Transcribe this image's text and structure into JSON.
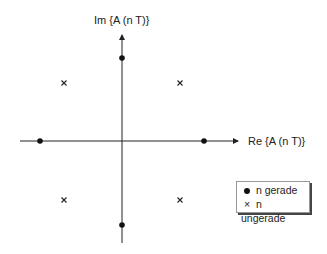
{
  "axes": {
    "y_label": "Im {A (n T)}",
    "x_label": "Re {A (n T)}"
  },
  "points": {
    "gerade": [
      [
        122,
        58
      ],
      [
        122,
        225
      ],
      [
        40,
        141
      ],
      [
        204,
        141
      ]
    ],
    "ungerade": [
      [
        64,
        83
      ],
      [
        180,
        83
      ],
      [
        64,
        200
      ],
      [
        180,
        200
      ]
    ]
  },
  "legend": {
    "items": [
      {
        "symbol": "dot",
        "label": "n gerade"
      },
      {
        "symbol": "cross",
        "label": "n ungerade"
      }
    ]
  }
}
